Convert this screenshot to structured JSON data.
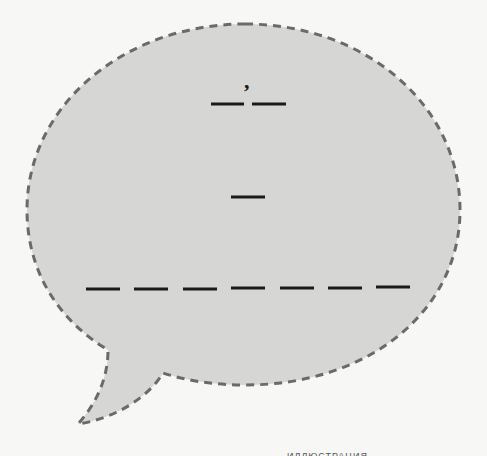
{
  "worksheet": {
    "type": "fill-in-the-blank speech bubble",
    "colors": {
      "background": "#f7f7f5",
      "bubble_fill": "#d6d6d4",
      "bubble_outline": "#6a6a6a",
      "blank_lines": "#1a1a1a"
    },
    "bubble": {
      "outline_style": "dashed",
      "has_tail": true,
      "tail_direction": "bottom-left"
    },
    "lines": [
      {
        "id": "line-1",
        "punctuation_above": ",",
        "blank_count": 2
      },
      {
        "id": "line-2",
        "punctuation_above": "",
        "blank_count": 1
      },
      {
        "id": "line-3",
        "punctuation_above": "",
        "blank_count": 7
      }
    ],
    "footer_caption": "ИЛЛЮСТРАЦИЯ"
  }
}
